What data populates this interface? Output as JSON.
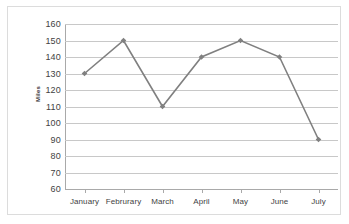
{
  "chart_data": {
    "type": "line",
    "title": "",
    "xlabel": "",
    "ylabel": "Miles",
    "categories": [
      "January",
      "Februrary",
      "March",
      "April",
      "May",
      "June",
      "July"
    ],
    "values": [
      130,
      150,
      110,
      140,
      150,
      140,
      90
    ],
    "series": [
      {
        "name": "Miles",
        "values": [
          130,
          150,
          110,
          140,
          150,
          140,
          90
        ]
      }
    ],
    "ylim": [
      60,
      160
    ],
    "ytick_step": 10,
    "ytick_labels": [
      "160",
      "150",
      "140",
      "130",
      "120",
      "110",
      "100",
      "90",
      "80",
      "70",
      "60"
    ],
    "grid": true,
    "legend": false,
    "legend_position": "none",
    "marker": "diamond",
    "colors": {
      "line": "#808080",
      "marker": "#808080",
      "gridline": "#c8c8c8",
      "axis": "#a9a9a9",
      "text": "#3f3f3f",
      "background": "#ffffff",
      "frame": "#dcdcdc"
    }
  }
}
